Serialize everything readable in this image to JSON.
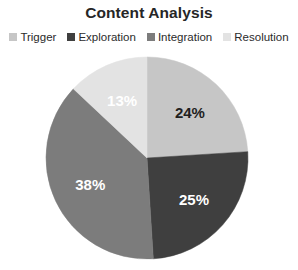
{
  "chart_data": {
    "type": "pie",
    "title": "Content Analysis",
    "categories": [
      "Trigger",
      "Exploration",
      "Integration",
      "Resolution"
    ],
    "values": [
      24,
      25,
      38,
      13
    ],
    "value_labels": [
      "24%",
      "25%",
      "38%",
      "13%"
    ],
    "value_unit": "%",
    "colors": [
      "#c6c6c6",
      "#3f3f3f",
      "#7c7c7c",
      "#e3e3e3"
    ],
    "label_text_colors": [
      "#1f1f1f",
      "#ffffff",
      "#ffffff",
      "#ffffff"
    ],
    "start_angle_deg": 0,
    "direction": "clockwise",
    "legend_position": "top",
    "grid": false,
    "xlabel": "",
    "ylabel": ""
  },
  "title": {
    "text": "Content Analysis"
  },
  "legend": {
    "items": [
      {
        "label": "Trigger",
        "color": "#c6c6c6"
      },
      {
        "label": "Exploration",
        "color": "#3f3f3f"
      },
      {
        "label": "Integration",
        "color": "#7c7c7c"
      },
      {
        "label": "Resolution",
        "color": "#e3e3e3"
      }
    ]
  },
  "slices": [
    {
      "name": "Trigger",
      "label": "24%",
      "value": 24,
      "color": "#c6c6c6",
      "text_color": "#1f1f1f"
    },
    {
      "name": "Exploration",
      "label": "25%",
      "value": 25,
      "color": "#3f3f3f",
      "text_color": "#ffffff"
    },
    {
      "name": "Integration",
      "label": "38%",
      "value": 38,
      "color": "#7c7c7c",
      "text_color": "#ffffff"
    },
    {
      "name": "Resolution",
      "label": "13%",
      "value": 13,
      "color": "#e3e3e3",
      "text_color": "#ffffff"
    }
  ],
  "geometry": {
    "center_x": 147,
    "center_y": 158,
    "radius": 101
  }
}
